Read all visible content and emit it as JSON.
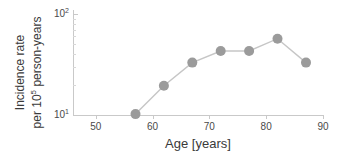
{
  "chart_data": {
    "type": "line",
    "title": "",
    "xlabel": "Age [years]",
    "ylabel_line1": "Incidence rate",
    "ylabel_line2": "per 10",
    "ylabel_line2_sup": "5",
    "ylabel_line2_rest": " person-years",
    "x": [
      57,
      62,
      67,
      72,
      77,
      82,
      87
    ],
    "values": [
      10.2,
      19.5,
      33,
      43,
      43,
      57,
      33
    ],
    "xlim": [
      46,
      90
    ],
    "ylim": [
      10,
      100
    ],
    "yscale": "log",
    "xticks": [
      50,
      60,
      70,
      80,
      90
    ],
    "xticklabels": [
      "50",
      "60",
      "70",
      "80",
      "90"
    ],
    "yticks": [
      10,
      100
    ],
    "yticklabels": [
      "10",
      "10"
    ],
    "yticklabel_exponents": [
      "1",
      "2"
    ],
    "y_minor_ticks": [
      20,
      30,
      40,
      50,
      60,
      70,
      80,
      90
    ],
    "grid": false,
    "legend": "none",
    "marker": "circle",
    "marker_color": "#9b9b9b",
    "line_color": "#c6c6c6",
    "axis_color": "#c9c9c9",
    "background": "#ffffff"
  }
}
